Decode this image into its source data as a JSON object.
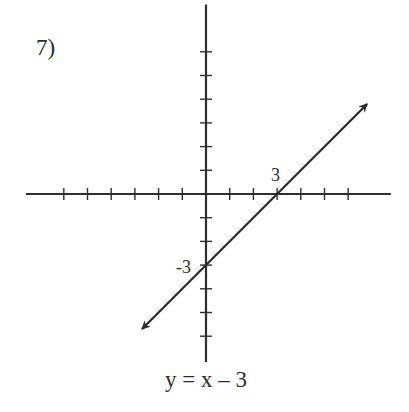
{
  "problem": {
    "number_label": "7)",
    "equation_label": "y = x – 3",
    "x_intercept_label": "3",
    "y_intercept_label": "-3"
  },
  "colors": {
    "axis": "#2e2e2e",
    "line": "#2a2a2a",
    "text": "#2b2b2b",
    "background": "#ffffff"
  },
  "chart_data": {
    "type": "line",
    "title": "",
    "equation": "y = x - 3",
    "slope": 1,
    "intercept": -3,
    "xlabel": "",
    "ylabel": "",
    "origin_px": [
      206,
      194
    ],
    "unit_px": 23.7,
    "xlim": [
      -7.6,
      7.8
    ],
    "ylim": [
      -7,
      8
    ],
    "x_ticks": [
      -6,
      -5,
      -4,
      -3,
      -2,
      -1,
      1,
      2,
      3,
      4,
      5,
      6
    ],
    "y_ticks": [
      -6,
      -5,
      -4,
      -3,
      -2,
      -1,
      1,
      2,
      3,
      4,
      5,
      6
    ],
    "grid": false,
    "legend": null,
    "arrows_both_ends": true,
    "series": [
      {
        "name": "y = x - 3",
        "x": [
          -2.7,
          0,
          3,
          6.8
        ],
        "y": [
          -5.7,
          -3,
          0,
          3.8
        ]
      }
    ],
    "annotations": [
      {
        "text": "3",
        "x": 3,
        "y": 0,
        "position": "above"
      },
      {
        "text": "-3",
        "x": 0,
        "y": -3,
        "position": "left"
      }
    ]
  }
}
